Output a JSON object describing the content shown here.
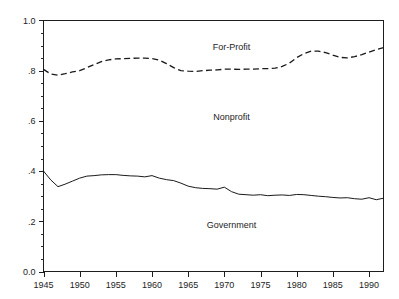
{
  "figure": {
    "title_sliver": "........",
    "width": 399,
    "height": 299
  },
  "chart_data": {
    "type": "line",
    "title": "",
    "subtitle": "",
    "xlabel": "",
    "ylabel": "",
    "xlim": [
      1945,
      1992
    ],
    "ylim": [
      0.0,
      1.0
    ],
    "grid": false,
    "legend": "inline-area-labels",
    "x_ticks_major": [
      1945,
      1950,
      1955,
      1960,
      1965,
      1970,
      1975,
      1980,
      1985,
      1990
    ],
    "x_tick_labels": [
      "1945",
      "1950",
      "1955",
      "1960",
      "1965",
      "1970",
      "1975",
      "1980",
      "1985",
      "1990"
    ],
    "x_minor_step": 1,
    "y_ticks_major": [
      0.0,
      0.2,
      0.4,
      0.6,
      0.8,
      1.0
    ],
    "y_tick_labels": [
      "0.0",
      ".2",
      ".4",
      ".6",
      ".8",
      "1.0"
    ],
    "y_minor_step": 0.05,
    "area_labels": [
      {
        "text": "For-Profit",
        "x": 1971,
        "y": 0.895
      },
      {
        "text": "Nonprofit",
        "x": 1971,
        "y": 0.615
      },
      {
        "text": "Government",
        "x": 1971,
        "y": 0.185
      }
    ],
    "series": [
      {
        "name": "For-Profit / Nonprofit boundary",
        "style": "dashed",
        "x": [
          1945,
          1946,
          1947,
          1948,
          1949,
          1950,
          1951,
          1952,
          1953,
          1954,
          1955,
          1956,
          1957,
          1958,
          1959,
          1960,
          1961,
          1962,
          1963,
          1964,
          1965,
          1966,
          1967,
          1968,
          1969,
          1970,
          1971,
          1972,
          1973,
          1974,
          1975,
          1976,
          1977,
          1978,
          1979,
          1980,
          1981,
          1982,
          1983,
          1984,
          1985,
          1986,
          1987,
          1988,
          1989,
          1990,
          1991,
          1992
        ],
        "values": [
          0.805,
          0.787,
          0.782,
          0.788,
          0.795,
          0.8,
          0.812,
          0.825,
          0.836,
          0.843,
          0.847,
          0.848,
          0.849,
          0.85,
          0.85,
          0.848,
          0.842,
          0.828,
          0.812,
          0.8,
          0.798,
          0.797,
          0.8,
          0.802,
          0.803,
          0.806,
          0.806,
          0.805,
          0.806,
          0.806,
          0.808,
          0.808,
          0.81,
          0.817,
          0.83,
          0.852,
          0.868,
          0.878,
          0.878,
          0.872,
          0.862,
          0.853,
          0.851,
          0.856,
          0.864,
          0.874,
          0.884,
          0.892
        ]
      },
      {
        "name": "Nonprofit / Government boundary",
        "style": "solid",
        "x": [
          1945,
          1946,
          1947,
          1948,
          1949,
          1950,
          1951,
          1952,
          1953,
          1954,
          1955,
          1956,
          1957,
          1958,
          1959,
          1960,
          1961,
          1962,
          1963,
          1964,
          1965,
          1966,
          1967,
          1968,
          1969,
          1970,
          1971,
          1972,
          1973,
          1974,
          1975,
          1976,
          1977,
          1978,
          1979,
          1980,
          1981,
          1982,
          1983,
          1984,
          1985,
          1986,
          1987,
          1988,
          1989,
          1990,
          1991,
          1992
        ],
        "values": [
          0.4,
          0.365,
          0.338,
          0.348,
          0.36,
          0.372,
          0.38,
          0.382,
          0.385,
          0.386,
          0.386,
          0.383,
          0.381,
          0.38,
          0.377,
          0.382,
          0.372,
          0.366,
          0.362,
          0.352,
          0.34,
          0.334,
          0.331,
          0.33,
          0.328,
          0.336,
          0.318,
          0.308,
          0.306,
          0.304,
          0.306,
          0.302,
          0.304,
          0.305,
          0.303,
          0.307,
          0.306,
          0.303,
          0.3,
          0.298,
          0.295,
          0.293,
          0.294,
          0.29,
          0.288,
          0.294,
          0.286,
          0.292
        ]
      }
    ]
  }
}
